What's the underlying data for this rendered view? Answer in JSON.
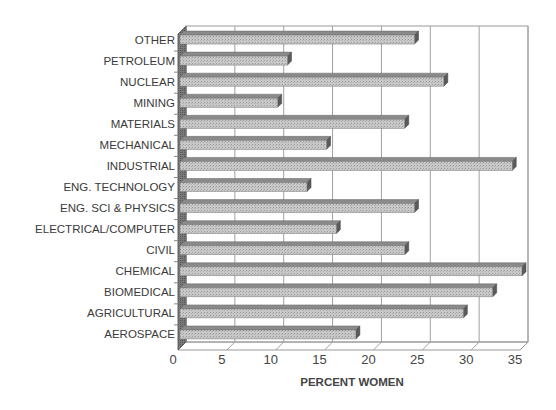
{
  "chart_data": {
    "type": "bar",
    "orientation": "horizontal",
    "style": "3d",
    "title": "",
    "xlabel": "PERCENT WOMEN",
    "ylabel": "",
    "xlim": [
      0,
      35
    ],
    "x_ticks": [
      "0",
      "5",
      "10",
      "15",
      "20",
      "25",
      "30",
      "35"
    ],
    "grid": true,
    "legend": null,
    "categories": [
      "OTHER",
      "PETROLEUM",
      "NUCLEAR",
      "MINING",
      "MATERIALS",
      "MECHANICAL",
      "INDUSTRIAL",
      "ENG. TECHNOLOGY",
      "ENG. SCI & PHYSICS",
      "ELECTRICAL/COMPUTER",
      "CIVIL",
      "CHEMICAL",
      "BIOMEDICAL",
      "AGRICULTURAL",
      "AEROSPACE"
    ],
    "values": [
      24,
      11,
      27,
      10,
      23,
      15,
      34,
      13,
      24,
      16,
      23,
      35,
      32,
      29,
      18
    ],
    "colors": {
      "bar_face": "#c8c8c8",
      "bar_top": "#8a8a8a",
      "bar_end": "#5a5a5a",
      "grid": "#a0a0a0",
      "wall": "#8c8c8c"
    }
  }
}
